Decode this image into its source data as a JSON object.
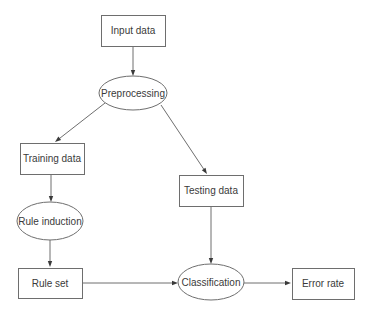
{
  "diagram": {
    "colors": {
      "stroke": "#6e6e6e",
      "text": "#3a3a3a",
      "arrowhead": "#3a3a3a",
      "background": "#ffffff"
    },
    "nodes": [
      {
        "id": "input_data",
        "label": "Input data",
        "shape": "rect",
        "x": 101,
        "y": 15,
        "w": 64,
        "h": 31
      },
      {
        "id": "preprocessing",
        "label": "Preprocessing",
        "shape": "ellipse",
        "cx": 133,
        "cy": 93,
        "rx": 34,
        "ry": 17
      },
      {
        "id": "training_data",
        "label": "Training data",
        "shape": "rect",
        "x": 20,
        "y": 143,
        "w": 64,
        "h": 31
      },
      {
        "id": "testing_data",
        "label": "Testing data",
        "shape": "rect",
        "x": 179,
        "y": 175,
        "w": 64,
        "h": 31
      },
      {
        "id": "rule_induction",
        "label": "Rule induction",
        "shape": "ellipse",
        "cx": 50,
        "cy": 221,
        "rx": 33,
        "ry": 19
      },
      {
        "id": "rule_set",
        "label": "Rule set",
        "shape": "rect",
        "x": 18,
        "y": 268,
        "w": 64,
        "h": 30
      },
      {
        "id": "classification",
        "label": "Classification",
        "shape": "ellipse",
        "cx": 211,
        "cy": 282,
        "rx": 33,
        "ry": 18
      },
      {
        "id": "error_rate",
        "label": "Error rate",
        "shape": "rect",
        "x": 292,
        "y": 268,
        "w": 62,
        "h": 31
      }
    ],
    "edges": [
      {
        "from": "input_data",
        "to": "preprocessing",
        "x1": 133,
        "y1": 46,
        "x2": 133,
        "y2": 76
      },
      {
        "from": "preprocessing",
        "to": "training_data",
        "x1": 105,
        "y1": 103,
        "x2": 55,
        "y2": 142
      },
      {
        "from": "preprocessing",
        "to": "testing_data",
        "x1": 161,
        "y1": 105,
        "x2": 207,
        "y2": 174
      },
      {
        "from": "training_data",
        "to": "rule_induction",
        "x1": 51,
        "y1": 174,
        "x2": 51,
        "y2": 202
      },
      {
        "from": "rule_induction",
        "to": "rule_set",
        "x1": 50,
        "y1": 240,
        "x2": 50,
        "y2": 267
      },
      {
        "from": "testing_data",
        "to": "classification",
        "x1": 211,
        "y1": 206,
        "x2": 211,
        "y2": 264
      },
      {
        "from": "rule_set",
        "to": "classification",
        "x1": 82,
        "y1": 283,
        "x2": 178,
        "y2": 283
      },
      {
        "from": "classification",
        "to": "error_rate",
        "x1": 244,
        "y1": 283,
        "x2": 291,
        "y2": 283
      }
    ]
  }
}
